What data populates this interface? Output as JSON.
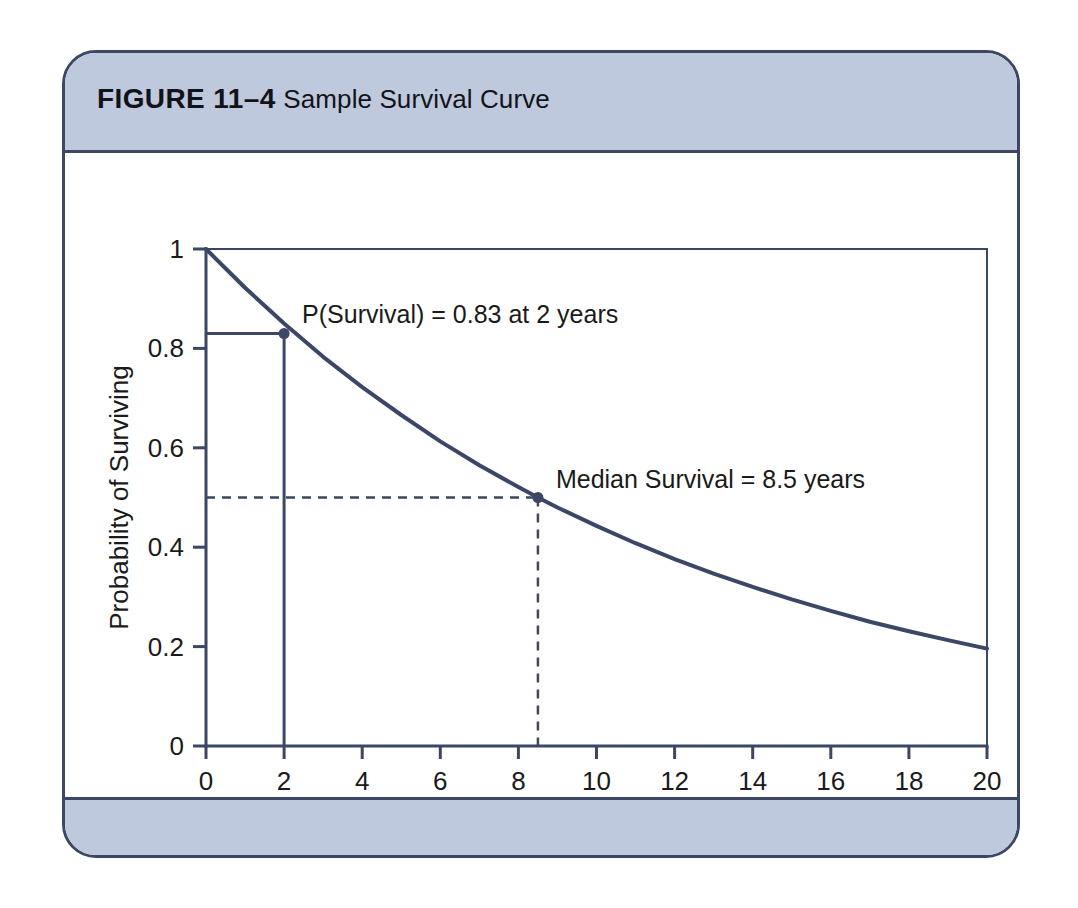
{
  "figure": {
    "label": "FIGURE 11–4",
    "caption": "Sample Survival Curve",
    "header_bg": "#bfc9dd",
    "border_color": "#3c4766"
  },
  "chart_data": {
    "type": "line",
    "title": "Sample Survival Curve",
    "xlabel": "Years",
    "ylabel": "Probability of Surviving",
    "xlim": [
      0,
      20
    ],
    "ylim": [
      0,
      1
    ],
    "xticks": [
      "0",
      "2",
      "4",
      "6",
      "8",
      "10",
      "12",
      "14",
      "16",
      "18",
      "20"
    ],
    "xtick_values": [
      0,
      2,
      4,
      6,
      8,
      10,
      12,
      14,
      16,
      18,
      20
    ],
    "yticks": [
      "0",
      "0.2",
      "0.4",
      "0.6",
      "0.8",
      "1"
    ],
    "ytick_values": [
      0,
      0.2,
      0.4,
      0.6,
      0.8,
      1
    ],
    "grid": false,
    "legend": null,
    "line_color": "#3c4766",
    "series": [
      {
        "name": "Survival probability",
        "model": "exponential decay S(t) = exp(-0.0815*t)",
        "x": [
          0,
          1,
          2,
          3,
          4,
          5,
          6,
          7,
          8,
          8.5,
          9,
          10,
          11,
          12,
          13,
          14,
          15,
          16,
          17,
          18,
          19,
          20
        ],
        "values": [
          1.0,
          0.922,
          0.85,
          0.783,
          0.722,
          0.666,
          0.613,
          0.565,
          0.521,
          0.5,
          0.48,
          0.443,
          0.408,
          0.376,
          0.347,
          0.32,
          0.295,
          0.272,
          0.25,
          0.231,
          0.213,
          0.196
        ]
      }
    ],
    "annotations": [
      {
        "id": "p-survival-2-years",
        "text": "P(Survival) = 0.83 at 2 years",
        "point": {
          "x": 2,
          "y": 0.83
        },
        "marker": true,
        "guide_style": "solid"
      },
      {
        "id": "median-survival",
        "text": "Median Survival = 8.5 years",
        "point": {
          "x": 8.5,
          "y": 0.5
        },
        "marker": true,
        "guide_style": "dashed"
      }
    ]
  }
}
